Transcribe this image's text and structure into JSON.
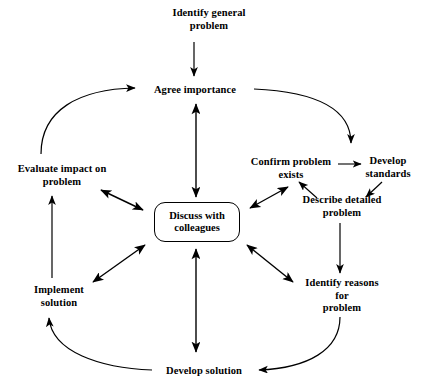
{
  "diagram": {
    "type": "cycle-diagram",
    "background_color": "#ffffff",
    "stroke_color": "#000000",
    "text_color": "#000000",
    "center": {
      "id": "discuss-with-colleagues",
      "label": "Discuss with\ncolleagues",
      "shape": "rounded-rectangle",
      "x": 197,
      "y": 222,
      "width": 86,
      "height": 40
    },
    "nodes": [
      {
        "id": "identify-general-problem",
        "label": "Identify general\nproblem",
        "x": 209,
        "y": 19
      },
      {
        "id": "agree-importance",
        "label": "Agree importance",
        "x": 195,
        "y": 90
      },
      {
        "id": "confirm-problem-exists",
        "label": "Confirm problem\nexists",
        "x": 291,
        "y": 168
      },
      {
        "id": "develop-standards",
        "label": "Develop\nstandards",
        "x": 388,
        "y": 167
      },
      {
        "id": "describe-detailed-problem",
        "label": "Describe detailed\nproblem",
        "x": 342,
        "y": 206
      },
      {
        "id": "identify-reasons-for-problem",
        "label": "Identify reasons for\nproblem",
        "x": 342,
        "y": 296
      },
      {
        "id": "develop-solution",
        "label": "Develop solution",
        "x": 204,
        "y": 371
      },
      {
        "id": "implement-solution",
        "label": "Implement\nsolution",
        "x": 59,
        "y": 296
      },
      {
        "id": "evaluate-impact-on-problem",
        "label": "Evaluate impact on\nproblem",
        "x": 62,
        "y": 175
      }
    ],
    "connectors": [
      {
        "id": "identify-general-problem-to-agree-importance",
        "from": "identify-general-problem",
        "to": "agree-importance",
        "style": "straight",
        "heads": "single"
      },
      {
        "id": "agree-importance-to-confirm-problem-exists",
        "from": "agree-importance",
        "to": "confirm-problem-exists",
        "style": "curved",
        "heads": "single"
      },
      {
        "id": "confirm-problem-exists-to-develop-standards",
        "from": "confirm-problem-exists",
        "to": "develop-standards",
        "style": "straight",
        "heads": "single"
      },
      {
        "id": "develop-standards-to-describe-detailed-problem",
        "from": "develop-standards",
        "to": "describe-detailed-problem",
        "style": "straight",
        "heads": "single"
      },
      {
        "id": "describe-detailed-problem-to-confirm-problem-exists",
        "from": "describe-detailed-problem",
        "to": "confirm-problem-exists",
        "style": "straight",
        "heads": "single"
      },
      {
        "id": "describe-detailed-problem-to-identify-reasons-for-problem",
        "from": "describe-detailed-problem",
        "to": "identify-reasons-for-problem",
        "style": "straight",
        "heads": "single"
      },
      {
        "id": "identify-reasons-for-problem-to-develop-solution",
        "from": "identify-reasons-for-problem",
        "to": "develop-solution",
        "style": "curved",
        "heads": "single"
      },
      {
        "id": "develop-solution-to-implement-solution",
        "from": "develop-solution",
        "to": "implement-solution",
        "style": "curved",
        "heads": "single"
      },
      {
        "id": "implement-solution-to-evaluate-impact-on-problem",
        "from": "implement-solution",
        "to": "evaluate-impact-on-problem",
        "style": "straight",
        "heads": "single"
      },
      {
        "id": "evaluate-impact-on-problem-to-agree-importance",
        "from": "evaluate-impact-on-problem",
        "to": "agree-importance",
        "style": "curved",
        "heads": "single"
      },
      {
        "id": "agree-importance-and-discuss-with-colleagues",
        "from": "agree-importance",
        "to": "discuss-with-colleagues",
        "style": "straight",
        "heads": "double"
      },
      {
        "id": "evaluate-impact-on-problem-and-discuss-with-colleagues",
        "from": "evaluate-impact-on-problem",
        "to": "discuss-with-colleagues",
        "style": "straight",
        "heads": "double"
      },
      {
        "id": "confirm-problem-exists-and-discuss-with-colleagues",
        "from": "confirm-problem-exists",
        "to": "discuss-with-colleagues",
        "style": "straight",
        "heads": "double"
      },
      {
        "id": "implement-solution-and-discuss-with-colleagues",
        "from": "implement-solution",
        "to": "discuss-with-colleagues",
        "style": "straight",
        "heads": "double"
      },
      {
        "id": "identify-reasons-for-problem-and-discuss-with-colleagues",
        "from": "identify-reasons-for-problem",
        "to": "discuss-with-colleagues",
        "style": "straight",
        "heads": "double"
      },
      {
        "id": "develop-solution-and-discuss-with-colleagues",
        "from": "develop-solution",
        "to": "discuss-with-colleagues",
        "style": "straight",
        "heads": "double"
      }
    ]
  }
}
